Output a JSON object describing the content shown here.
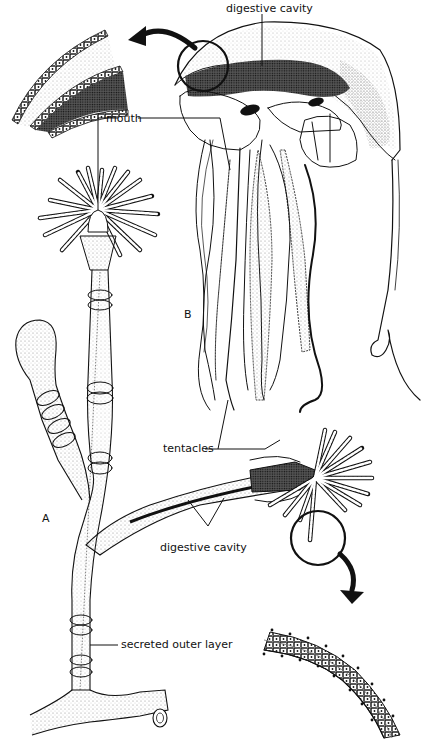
{
  "figure": {
    "parts": [
      {
        "id": "A",
        "label": "A",
        "subject": "hydroid polyp colony"
      },
      {
        "id": "B",
        "label": "B",
        "subject": "medusa (jellyfish)"
      }
    ],
    "labels": {
      "digestive_cavity_top": "digestive cavity",
      "mouth": "mouth",
      "tentacles": "tentacles",
      "digestive_cavity_bottom": "digestive cavity",
      "secreted_outer_layer": "secreted outer layer",
      "part_a": "A",
      "part_b": "B"
    },
    "insets": [
      {
        "name": "medusa-bell-wall-magnified",
        "position": "top-left"
      },
      {
        "name": "tentacle-magnified",
        "position": "bottom-right"
      }
    ],
    "colors": {
      "ink": "#111111",
      "background": "#ffffff",
      "stipple_dark": "#222222",
      "stipple_light": "#9a9a9a"
    }
  }
}
